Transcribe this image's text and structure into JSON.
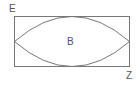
{
  "diagram": {
    "type": "geometry-figure",
    "labels": {
      "corner_top_left": "E",
      "center": "B",
      "corner_bottom_right": "Z"
    },
    "shapes": {
      "rectangle": {
        "x": 14,
        "y": 16,
        "width": 115,
        "height": 50
      },
      "lens": {
        "left_point": [
          14,
          41
        ],
        "right_point": [
          129,
          41
        ],
        "top_touch": [
          71,
          16
        ],
        "bottom_touch": [
          71,
          66
        ]
      }
    },
    "colors": {
      "stroke": "#777777",
      "text": "#555555",
      "background": "#ffffff"
    }
  }
}
